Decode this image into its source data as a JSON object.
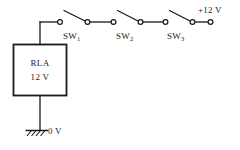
{
  "diagram": {
    "colors": {
      "ink": "#1a1a1a",
      "background": "#ffffff"
    },
    "component": {
      "name": "RLA",
      "rating": "12 V"
    },
    "supply": {
      "label": "+12 V"
    },
    "ground": {
      "label": "0 V"
    },
    "switches": [
      {
        "name": "SW",
        "index": "1",
        "state": "open"
      },
      {
        "name": "SW",
        "index": "2",
        "state": "open"
      },
      {
        "name": "SW",
        "index": "3",
        "state": "open"
      }
    ]
  }
}
